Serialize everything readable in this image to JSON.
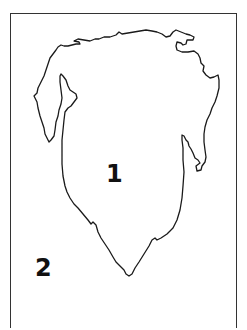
{
  "map": {
    "type": "outline-map",
    "outline_color": "#1a1a1a",
    "frame_color": "#333333",
    "background": "#ffffff",
    "labels": [
      {
        "id": "1",
        "text": "1",
        "description": "landmass region"
      },
      {
        "id": "2",
        "text": "2",
        "description": "surrounding water region"
      }
    ]
  }
}
